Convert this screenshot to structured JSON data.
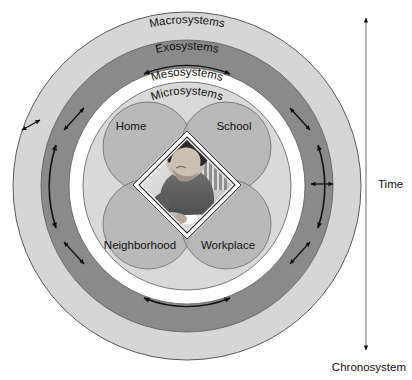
{
  "figure": {
    "rings": [
      {
        "key": "macrosystems",
        "label": "Macrosystems",
        "color": "#d6d6d6"
      },
      {
        "key": "exosystems",
        "label": "Exosystems",
        "color": "#8a8a8a"
      },
      {
        "key": "mesosystems",
        "label": "Mesosystems",
        "color": "#ffffff"
      },
      {
        "key": "microsystems",
        "label": "Microsystems",
        "color": "#d9d9d9"
      }
    ],
    "microsystem_circles": [
      {
        "key": "home",
        "label": "Home"
      },
      {
        "key": "school",
        "label": "School"
      },
      {
        "key": "neighborhood",
        "label": "Neighborhood"
      },
      {
        "key": "workplace",
        "label": "Workplace"
      }
    ],
    "center_photo": {
      "alt": "Child writing at a desk in a chair",
      "shape": "diamond"
    },
    "time_axis": {
      "label": "Time",
      "bottom_label": "Chronosystem",
      "direction": "double-headed vertical arrow"
    },
    "colors": {
      "macrosystem_fill": "#d6d6d6",
      "exosystem_fill": "#8a8a8a",
      "mesosystem_fill": "#ffffff",
      "microsystem_fill": "#d9d9d9",
      "circle_fill": "#b5b5b5",
      "circle_overlap_fill": "#9a9a9a",
      "outline": "#4a4a4a",
      "arrow": "#111111",
      "text": "#111111",
      "background": "#ffffff"
    }
  }
}
